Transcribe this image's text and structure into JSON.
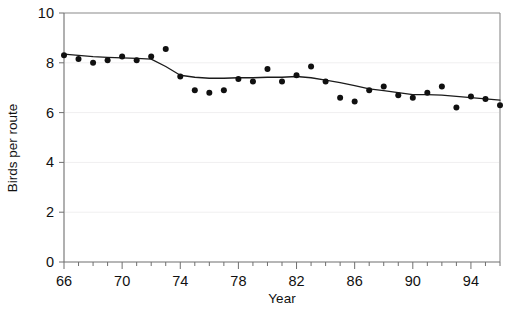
{
  "chart_data": {
    "type": "scatter",
    "title": "",
    "xlabel": "Year",
    "ylabel": "Birds per route",
    "xlim": [
      1966,
      1996
    ],
    "ylim": [
      0,
      10
    ],
    "xticks": [
      1966,
      1967,
      1968,
      1969,
      1970,
      1971,
      1972,
      1973,
      1974,
      1975,
      1976,
      1977,
      1978,
      1979,
      1980,
      1981,
      1982,
      1983,
      1984,
      1985,
      1986,
      1987,
      1988,
      1989,
      1990,
      1991,
      1992,
      1993,
      1994,
      1995,
      1996
    ],
    "xtick_labels": [
      "66",
      "",
      "",
      "",
      "70",
      "",
      "",
      "",
      "74",
      "",
      "",
      "",
      "78",
      "",
      "",
      "",
      "82",
      "",
      "",
      "",
      "86",
      "",
      "",
      "",
      "90",
      "",
      "",
      "",
      "94",
      "",
      ""
    ],
    "yticks": [
      0,
      2,
      4,
      6,
      8,
      10
    ],
    "ytick_labels": [
      "0",
      "2",
      "4",
      "6",
      "8",
      "10"
    ],
    "grid": "faint horizontal gridlines at 2, 4, 6, 8",
    "legend": "none",
    "marker": "filled-circle",
    "marker_color": "#101010",
    "line_color": "#1b1b1b",
    "series": [
      {
        "name": "Observed birds per route",
        "type": "scatter",
        "x": [
          1966,
          1967,
          1968,
          1969,
          1970,
          1971,
          1972,
          1973,
          1974,
          1975,
          1976,
          1977,
          1978,
          1979,
          1980,
          1981,
          1982,
          1983,
          1984,
          1985,
          1986,
          1987,
          1988,
          1989,
          1990,
          1991,
          1992,
          1993,
          1994,
          1995,
          1996
        ],
        "y": [
          8.3,
          8.15,
          8.0,
          8.1,
          8.25,
          8.1,
          8.25,
          8.55,
          7.45,
          6.9,
          6.8,
          6.9,
          7.35,
          7.25,
          7.75,
          7.25,
          7.5,
          7.85,
          7.25,
          6.6,
          6.45,
          6.9,
          7.05,
          6.7,
          6.6,
          6.8,
          7.05,
          6.2,
          6.65,
          6.55,
          6.3
        ]
      },
      {
        "name": "Smoothed trend",
        "type": "line",
        "x": [
          1966,
          1967,
          1968,
          1969,
          1970,
          1971,
          1972,
          1973,
          1974,
          1975,
          1976,
          1977,
          1978,
          1979,
          1980,
          1981,
          1982,
          1983,
          1984,
          1985,
          1986,
          1987,
          1988,
          1989,
          1990,
          1991,
          1992,
          1993,
          1994,
          1995,
          1996
        ],
        "y": [
          8.35,
          8.3,
          8.25,
          8.22,
          8.2,
          8.18,
          8.15,
          7.85,
          7.5,
          7.42,
          7.38,
          7.38,
          7.4,
          7.4,
          7.42,
          7.42,
          7.45,
          7.4,
          7.3,
          7.2,
          7.08,
          6.95,
          6.88,
          6.8,
          6.72,
          6.72,
          6.7,
          6.65,
          6.6,
          6.55,
          6.5
        ]
      }
    ]
  },
  "axis": {
    "y_title": "Birds per route",
    "x_title": "Year"
  }
}
